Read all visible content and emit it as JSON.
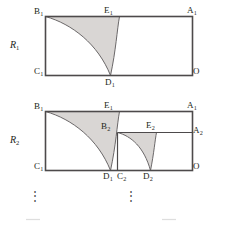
{
  "figure": {
    "colors": {
      "stroke": "#4d4a4b",
      "stroke_dark": "#3a3738",
      "shade_fill": "#d9d6d4",
      "curve": "#6b6869",
      "label_text": "#231f20",
      "dots": "#4a4a4a",
      "background": "#ffffff"
    },
    "stage_labels": [
      {
        "id": "R1",
        "text": "R",
        "sub": "1"
      },
      {
        "id": "R2",
        "text": "R",
        "sub": "2"
      }
    ],
    "ellipsis": {
      "glyph": "⋮",
      "count": 2
    },
    "stage_one": {
      "name": "R1",
      "vertices": [
        {
          "id": "B1",
          "text": "B",
          "sub": "1",
          "position": "top-left"
        },
        {
          "id": "E1",
          "text": "E",
          "sub": "1",
          "position": "top-middle"
        },
        {
          "id": "A1",
          "text": "A",
          "sub": "1",
          "position": "top-right"
        },
        {
          "id": "C1",
          "text": "C",
          "sub": "1",
          "position": "bottom-left"
        },
        {
          "id": "D1",
          "text": "D",
          "sub": "1",
          "position": "bottom-middle"
        },
        {
          "id": "O",
          "text": "O",
          "sub": "",
          "position": "bottom-right"
        }
      ]
    },
    "stage_two": {
      "name": "R2",
      "vertices": [
        {
          "id": "B1",
          "text": "B",
          "sub": "1",
          "position": "top-left"
        },
        {
          "id": "E1",
          "text": "E",
          "sub": "1",
          "position": "top-middle"
        },
        {
          "id": "A1",
          "text": "A",
          "sub": "1",
          "position": "top-right"
        },
        {
          "id": "B2",
          "text": "B",
          "sub": "2",
          "position": "inner-top-left"
        },
        {
          "id": "E2",
          "text": "E",
          "sub": "2",
          "position": "inner-top-middle"
        },
        {
          "id": "A2",
          "text": "A",
          "sub": "2",
          "position": "inner-top-right"
        },
        {
          "id": "C1",
          "text": "C",
          "sub": "1",
          "position": "bottom-left"
        },
        {
          "id": "D1",
          "text": "D",
          "sub": "1",
          "position": "bottom"
        },
        {
          "id": "C2",
          "text": "C",
          "sub": "2",
          "position": "bottom"
        },
        {
          "id": "D2",
          "text": "D",
          "sub": "2",
          "position": "bottom"
        },
        {
          "id": "O",
          "text": "O",
          "sub": "",
          "position": "bottom-right"
        }
      ]
    }
  }
}
